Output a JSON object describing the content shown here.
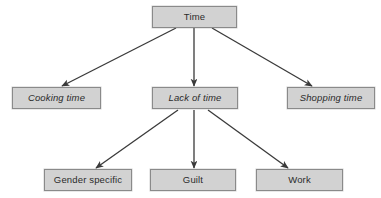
{
  "diagram": {
    "title": "Time",
    "type": "hierarchical-tree",
    "background_color": "#ffffff",
    "node_fill_color": "#d2d2d2",
    "node_border_color": "#8a8a8a",
    "edge_color": "#3a3a3a",
    "nodes": [
      {
        "id": "time",
        "label": "Time",
        "style": "normal",
        "level": 0,
        "x": 152,
        "y": 6,
        "width": 85,
        "height": 22
      },
      {
        "id": "cooking-time",
        "label": "Cooking time",
        "style": "italic",
        "level": 1,
        "x": 12,
        "y": 87,
        "width": 89,
        "height": 22
      },
      {
        "id": "lack-of-time",
        "label": "Lack of time",
        "style": "italic",
        "level": 1,
        "x": 152,
        "y": 87,
        "width": 86,
        "height": 22
      },
      {
        "id": "shopping-time",
        "label": "Shopping time",
        "style": "italic",
        "level": 1,
        "x": 287,
        "y": 87,
        "width": 88,
        "height": 22
      },
      {
        "id": "gender-specific",
        "label": "Gender specific",
        "style": "normal",
        "level": 2,
        "x": 44,
        "y": 169,
        "width": 88,
        "height": 22
      },
      {
        "id": "guilt",
        "label": "Guilt",
        "style": "normal",
        "level": 2,
        "x": 150,
        "y": 169,
        "width": 86,
        "height": 22
      },
      {
        "id": "work",
        "label": "Work",
        "style": "normal",
        "level": 2,
        "x": 256,
        "y": 169,
        "width": 87,
        "height": 22
      }
    ],
    "edges": [
      {
        "id": "time-to-cooking-time",
        "from": "time",
        "to": "cooking-time",
        "x1": 176,
        "y1": 28,
        "x2": 62,
        "y2": 86
      },
      {
        "id": "time-to-lack-of-time",
        "from": "time",
        "to": "lack-of-time",
        "x1": 194,
        "y1": 28,
        "x2": 194,
        "y2": 86
      },
      {
        "id": "time-to-shopping-time",
        "from": "time",
        "to": "shopping-time",
        "x1": 212,
        "y1": 28,
        "x2": 312,
        "y2": 86
      },
      {
        "id": "lack-to-gender-specific",
        "from": "lack-of-time",
        "to": "gender-specific",
        "x1": 178,
        "y1": 110,
        "x2": 96,
        "y2": 168
      },
      {
        "id": "lack-to-guilt",
        "from": "lack-of-time",
        "to": "guilt",
        "x1": 194,
        "y1": 110,
        "x2": 194,
        "y2": 168
      },
      {
        "id": "lack-to-work",
        "from": "lack-of-time",
        "to": "work",
        "x1": 208,
        "y1": 110,
        "x2": 288,
        "y2": 168
      }
    ]
  }
}
